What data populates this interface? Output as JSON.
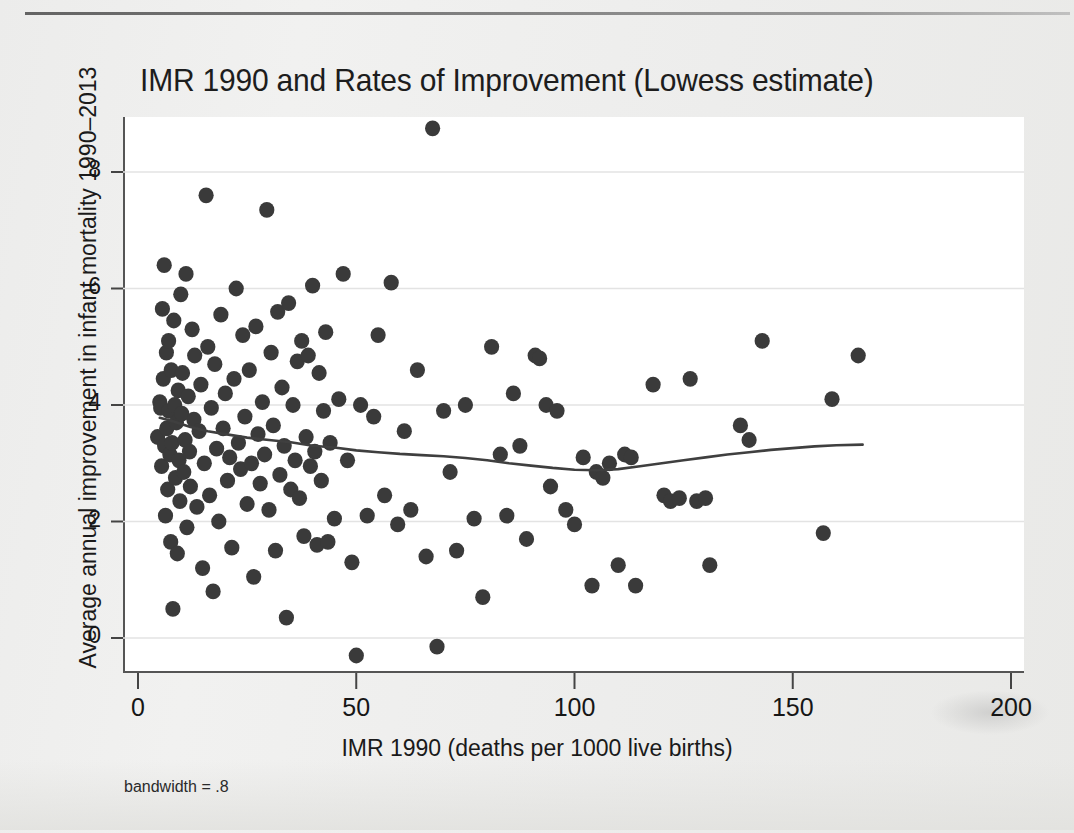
{
  "figure": {
    "title": "IMR 1990 and Rates of Improvement (Lowess estimate)",
    "note": "bandwidth = .8",
    "background_color": "#eeeeec",
    "plot_background_color": "#ffffff",
    "marker_color": "#3a3a3a",
    "line_color": "#444444"
  },
  "chart_data": {
    "type": "scatter",
    "title": "IMR 1990 and Rates of Improvement (Lowess estimate)",
    "xlabel": "IMR 1990 (deaths per 1000 live births)",
    "ylabel": "Average annual improvement in infant mortality 1990–2013",
    "annotation": "bandwidth = .8",
    "grid": true,
    "legend": "none",
    "xlim": [
      0,
      200
    ],
    "ylim": [
      -0.6,
      9.2
    ],
    "xticks": [
      0,
      50,
      100,
      150,
      200
    ],
    "yticks": [
      0,
      2,
      4,
      6,
      8
    ],
    "xtick_labels": [
      "0",
      "50",
      "100",
      "150",
      "200"
    ],
    "ytick_labels": [
      "0",
      "2",
      "4",
      "6",
      "8"
    ],
    "series": [
      {
        "name": "Countries",
        "type": "scatter",
        "points": [
          [
            4.5,
            3.45
          ],
          [
            5.0,
            4.05
          ],
          [
            5.2,
            3.95
          ],
          [
            5.4,
            2.95
          ],
          [
            5.6,
            5.65
          ],
          [
            5.8,
            4.45
          ],
          [
            6.0,
            6.4
          ],
          [
            6.1,
            3.3
          ],
          [
            6.3,
            2.1
          ],
          [
            6.5,
            4.9
          ],
          [
            6.6,
            3.6
          ],
          [
            6.8,
            2.55
          ],
          [
            7.0,
            5.1
          ],
          [
            7.1,
            3.9
          ],
          [
            7.3,
            3.15
          ],
          [
            7.5,
            1.65
          ],
          [
            7.6,
            4.6
          ],
          [
            7.8,
            3.35
          ],
          [
            8.0,
            0.5
          ],
          [
            8.2,
            5.45
          ],
          [
            8.4,
            4.0
          ],
          [
            8.6,
            2.75
          ],
          [
            8.8,
            3.7
          ],
          [
            9.0,
            1.45
          ],
          [
            9.2,
            4.25
          ],
          [
            9.4,
            3.05
          ],
          [
            9.6,
            2.35
          ],
          [
            9.8,
            5.9
          ],
          [
            10.0,
            3.85
          ],
          [
            10.2,
            4.55
          ],
          [
            10.5,
            2.85
          ],
          [
            10.8,
            3.4
          ],
          [
            11.0,
            6.25
          ],
          [
            11.2,
            1.9
          ],
          [
            11.5,
            4.15
          ],
          [
            11.8,
            3.2
          ],
          [
            12.0,
            2.6
          ],
          [
            12.4,
            5.3
          ],
          [
            12.8,
            3.75
          ],
          [
            13.0,
            4.85
          ],
          [
            13.5,
            2.25
          ],
          [
            14.0,
            3.55
          ],
          [
            14.4,
            4.35
          ],
          [
            14.8,
            1.2
          ],
          [
            15.2,
            3.0
          ],
          [
            15.6,
            7.6
          ],
          [
            16.0,
            5.0
          ],
          [
            16.4,
            2.45
          ],
          [
            16.8,
            3.95
          ],
          [
            17.2,
            0.8
          ],
          [
            17.6,
            4.7
          ],
          [
            18.0,
            3.25
          ],
          [
            18.5,
            2.0
          ],
          [
            19.0,
            5.55
          ],
          [
            19.5,
            3.6
          ],
          [
            20.0,
            4.2
          ],
          [
            20.5,
            2.7
          ],
          [
            21.0,
            3.1
          ],
          [
            21.5,
            1.55
          ],
          [
            22.0,
            4.45
          ],
          [
            22.5,
            6.0
          ],
          [
            23.0,
            3.35
          ],
          [
            23.5,
            2.9
          ],
          [
            24.0,
            5.2
          ],
          [
            24.5,
            3.8
          ],
          [
            25.0,
            2.3
          ],
          [
            25.5,
            4.6
          ],
          [
            26.0,
            3.0
          ],
          [
            26.5,
            1.05
          ],
          [
            27.0,
            5.35
          ],
          [
            27.5,
            3.5
          ],
          [
            28.0,
            2.65
          ],
          [
            28.5,
            4.05
          ],
          [
            29.0,
            3.15
          ],
          [
            29.5,
            7.35
          ],
          [
            30.0,
            2.2
          ],
          [
            30.5,
            4.9
          ],
          [
            31.0,
            3.65
          ],
          [
            31.5,
            1.5
          ],
          [
            32.0,
            5.6
          ],
          [
            32.5,
            2.8
          ],
          [
            33.0,
            4.3
          ],
          [
            33.5,
            3.3
          ],
          [
            34.0,
            0.35
          ],
          [
            34.5,
            5.75
          ],
          [
            35.0,
            2.55
          ],
          [
            35.5,
            4.0
          ],
          [
            36.0,
            3.05
          ],
          [
            36.5,
            4.75
          ],
          [
            37.0,
            2.4
          ],
          [
            37.5,
            5.1
          ],
          [
            38.0,
            1.75
          ],
          [
            38.5,
            3.45
          ],
          [
            39.0,
            4.85
          ],
          [
            39.5,
            2.95
          ],
          [
            40.0,
            6.05
          ],
          [
            40.5,
            3.2
          ],
          [
            41.0,
            1.6
          ],
          [
            41.5,
            4.55
          ],
          [
            42.0,
            2.7
          ],
          [
            42.5,
            3.9
          ],
          [
            43.0,
            5.25
          ],
          [
            43.5,
            1.65
          ],
          [
            44.0,
            3.35
          ],
          [
            45.0,
            2.05
          ],
          [
            46.0,
            4.1
          ],
          [
            47.0,
            6.25
          ],
          [
            48.0,
            3.05
          ],
          [
            49.0,
            1.3
          ],
          [
            50.0,
            -0.3
          ],
          [
            51.0,
            4.0
          ],
          [
            52.5,
            2.1
          ],
          [
            54.0,
            3.8
          ],
          [
            55.0,
            5.2
          ],
          [
            56.5,
            2.45
          ],
          [
            58.0,
            6.1
          ],
          [
            59.5,
            1.95
          ],
          [
            61.0,
            3.55
          ],
          [
            62.5,
            2.2
          ],
          [
            64.0,
            4.6
          ],
          [
            66.0,
            1.4
          ],
          [
            67.5,
            8.75
          ],
          [
            68.5,
            -0.15
          ],
          [
            70.0,
            3.9
          ],
          [
            71.5,
            2.85
          ],
          [
            73.0,
            1.5
          ],
          [
            75.0,
            4.0
          ],
          [
            77.0,
            2.05
          ],
          [
            79.0,
            0.7
          ],
          [
            81.0,
            5.0
          ],
          [
            83.0,
            3.15
          ],
          [
            84.5,
            2.1
          ],
          [
            86.0,
            4.2
          ],
          [
            87.5,
            3.3
          ],
          [
            89.0,
            1.7
          ],
          [
            91.0,
            4.85
          ],
          [
            92.0,
            4.8
          ],
          [
            93.5,
            4.0
          ],
          [
            94.5,
            2.6
          ],
          [
            96.0,
            3.9
          ],
          [
            98.0,
            2.2
          ],
          [
            100.0,
            1.95
          ],
          [
            102.0,
            3.1
          ],
          [
            104.0,
            0.9
          ],
          [
            105.0,
            2.85
          ],
          [
            106.5,
            2.75
          ],
          [
            108.0,
            3.0
          ],
          [
            110.0,
            1.25
          ],
          [
            111.5,
            3.15
          ],
          [
            113.0,
            3.1
          ],
          [
            114.0,
            0.9
          ],
          [
            118.0,
            4.35
          ],
          [
            120.5,
            2.45
          ],
          [
            122.0,
            2.35
          ],
          [
            124.0,
            2.4
          ],
          [
            126.5,
            4.45
          ],
          [
            128.0,
            2.35
          ],
          [
            130.0,
            2.4
          ],
          [
            131.0,
            1.25
          ],
          [
            138.0,
            3.65
          ],
          [
            140.0,
            3.4
          ],
          [
            143.0,
            5.1
          ],
          [
            157.0,
            1.8
          ],
          [
            159.0,
            4.1
          ],
          [
            165.0,
            4.85
          ]
        ]
      },
      {
        "name": "Lowess smooth",
        "type": "line",
        "points": [
          [
            5,
            3.78
          ],
          [
            8,
            3.72
          ],
          [
            12,
            3.62
          ],
          [
            16,
            3.55
          ],
          [
            20,
            3.5
          ],
          [
            25,
            3.44
          ],
          [
            30,
            3.4
          ],
          [
            35,
            3.36
          ],
          [
            40,
            3.3
          ],
          [
            45,
            3.27
          ],
          [
            50,
            3.22
          ],
          [
            55,
            3.19
          ],
          [
            60,
            3.16
          ],
          [
            65,
            3.14
          ],
          [
            70,
            3.12
          ],
          [
            75,
            3.09
          ],
          [
            80,
            3.05
          ],
          [
            85,
            3.0
          ],
          [
            90,
            2.96
          ],
          [
            95,
            2.92
          ],
          [
            100,
            2.89
          ],
          [
            105,
            2.88
          ],
          [
            110,
            2.9
          ],
          [
            115,
            2.95
          ],
          [
            120,
            3.0
          ],
          [
            125,
            3.05
          ],
          [
            130,
            3.1
          ],
          [
            135,
            3.15
          ],
          [
            140,
            3.19
          ],
          [
            145,
            3.23
          ],
          [
            150,
            3.26
          ],
          [
            155,
            3.29
          ],
          [
            160,
            3.31
          ],
          [
            166,
            3.32
          ]
        ]
      }
    ]
  }
}
